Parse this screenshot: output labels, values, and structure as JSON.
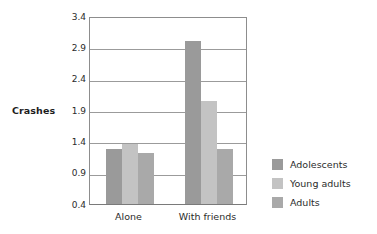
{
  "chart_data": {
    "type": "bar",
    "title": "",
    "xlabel": "",
    "ylabel": "Crashes",
    "categories": [
      "Alone",
      "With friends"
    ],
    "series": [
      {
        "name": "Adolescents",
        "color": "#9a9a9a",
        "values": [
          1.28,
          3.0
        ]
      },
      {
        "name": "Young adults",
        "color": "#c3c3c3",
        "values": [
          1.36,
          2.05
        ]
      },
      {
        "name": "Adults",
        "color": "#a9a9a9",
        "values": [
          1.22,
          1.28
        ]
      }
    ],
    "ylim": [
      0.4,
      3.4
    ],
    "yticks": [
      "0.4",
      "0.9",
      "1.4",
      "1.9",
      "2.4",
      "2.9",
      "3.4"
    ],
    "ytick_values": [
      0.4,
      0.9,
      1.4,
      1.9,
      2.4,
      2.9,
      3.4
    ],
    "grid": true,
    "legend_position": "right"
  },
  "legend": {
    "entries": [
      {
        "label": "Adolescents"
      },
      {
        "label": "Young adults"
      },
      {
        "label": "Adults"
      }
    ]
  }
}
